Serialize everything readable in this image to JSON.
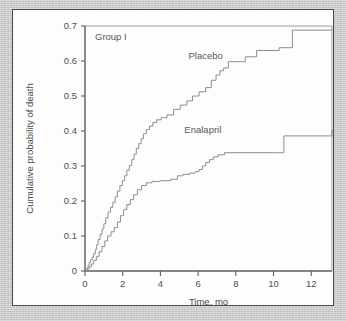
{
  "figure": {
    "panel_background": "#fdfdfd",
    "page_background": "#c9c9c9",
    "curve_color": "#8e8e8e",
    "axis_color": "#5d5d5d",
    "text_color": "#4f4f4f"
  },
  "chart_data": {
    "type": "line",
    "subtype": "kaplan-meier-step",
    "title": "",
    "annotation": "Group I",
    "xlabel": "Time, mo",
    "ylabel": "Cumulative probability of death",
    "xlim": [
      0,
      13.1
    ],
    "ylim": [
      0,
      0.7
    ],
    "xticks": [
      0,
      2,
      4,
      6,
      8,
      10,
      12
    ],
    "xticklabels": [
      "0",
      "2",
      "4",
      "6",
      "8",
      "10",
      "12"
    ],
    "yticks": [
      0,
      0.1,
      0.2,
      0.3,
      0.4,
      0.5,
      0.6,
      0.7
    ],
    "yticklabels": [
      "0",
      "0.1",
      "0.2",
      "0.3",
      "0.4",
      "0.5",
      "0.6",
      "0.7"
    ],
    "grid": false,
    "legend": "inline-annotations",
    "series": [
      {
        "name": "Placebo",
        "label_x": 6.4,
        "label_y": 0.605,
        "x": [
          0.0,
          0.1,
          0.16,
          0.22,
          0.3,
          0.38,
          0.46,
          0.55,
          0.62,
          0.7,
          0.8,
          0.9,
          1.0,
          1.1,
          1.22,
          1.35,
          1.48,
          1.6,
          1.72,
          1.85,
          1.98,
          2.1,
          2.22,
          2.35,
          2.48,
          2.6,
          2.72,
          2.85,
          2.98,
          3.1,
          3.25,
          3.42,
          3.6,
          3.8,
          4.05,
          4.35,
          4.7,
          5.05,
          5.4,
          5.7,
          6.05,
          6.4,
          6.7,
          6.95,
          7.15,
          7.35,
          7.6,
          8.5,
          9.1,
          10.3,
          11.0,
          13.1
        ],
        "y": [
          0.0,
          0.008,
          0.016,
          0.024,
          0.032,
          0.04,
          0.05,
          0.062,
          0.075,
          0.09,
          0.105,
          0.12,
          0.135,
          0.152,
          0.168,
          0.182,
          0.196,
          0.212,
          0.228,
          0.244,
          0.258,
          0.272,
          0.288,
          0.302,
          0.318,
          0.334,
          0.35,
          0.364,
          0.378,
          0.392,
          0.404,
          0.414,
          0.424,
          0.432,
          0.438,
          0.446,
          0.462,
          0.474,
          0.486,
          0.5,
          0.512,
          0.524,
          0.545,
          0.56,
          0.572,
          0.58,
          0.598,
          0.612,
          0.63,
          0.638,
          0.688,
          0.688
        ]
      },
      {
        "name": "Enalapril",
        "label_x": 6.25,
        "label_y": 0.395,
        "x": [
          0.0,
          0.12,
          0.22,
          0.34,
          0.46,
          0.6,
          0.75,
          0.9,
          1.05,
          1.2,
          1.38,
          1.55,
          1.72,
          1.88,
          2.05,
          2.22,
          2.4,
          2.58,
          2.78,
          3.0,
          3.25,
          3.55,
          4.0,
          4.55,
          4.9,
          5.2,
          5.55,
          5.85,
          6.05,
          6.22,
          6.4,
          6.6,
          6.8,
          7.05,
          7.4,
          10.2,
          10.55,
          13.1
        ],
        "y": [
          0.0,
          0.006,
          0.012,
          0.02,
          0.03,
          0.042,
          0.055,
          0.07,
          0.086,
          0.1,
          0.112,
          0.124,
          0.14,
          0.158,
          0.176,
          0.19,
          0.204,
          0.218,
          0.232,
          0.244,
          0.252,
          0.256,
          0.258,
          0.262,
          0.272,
          0.276,
          0.28,
          0.284,
          0.29,
          0.3,
          0.31,
          0.318,
          0.326,
          0.332,
          0.338,
          0.338,
          0.386,
          0.403
        ]
      }
    ]
  }
}
